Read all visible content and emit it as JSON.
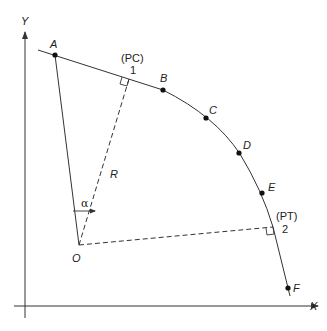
{
  "diagram": {
    "type": "circular-curve-geometry",
    "axes": {
      "x_label": "X",
      "y_label": "Y"
    },
    "points": [
      {
        "id": "A",
        "label": "A",
        "x": 55,
        "y": 55
      },
      {
        "id": "B",
        "label": "B",
        "x": 163,
        "y": 90
      },
      {
        "id": "C",
        "label": "C",
        "x": 206,
        "y": 118
      },
      {
        "id": "D",
        "label": "D",
        "x": 239,
        "y": 153
      },
      {
        "id": "E",
        "label": "E",
        "x": 262,
        "y": 193
      },
      {
        "id": "F",
        "label": "F",
        "x": 288,
        "y": 288
      }
    ],
    "center": {
      "label": "O",
      "x": 79,
      "y": 245
    },
    "pc": {
      "tag": "(PC)",
      "number": "1",
      "x": 129,
      "y": 79
    },
    "pt": {
      "tag": "(PT)",
      "number": "2",
      "x": 273,
      "y": 227
    },
    "radius_label": "R",
    "angle_label": "α",
    "colors": {
      "line": "#333333",
      "point": "#111111",
      "text": "#222222",
      "background": "#ffffff"
    }
  }
}
